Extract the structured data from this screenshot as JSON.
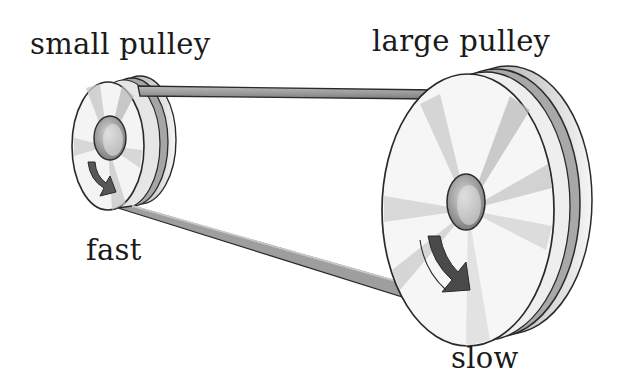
{
  "diagram": {
    "labels": {
      "small_pulley": "small pulley",
      "large_pulley": "large pulley",
      "small_speed": "fast",
      "large_speed": "slow"
    },
    "components": [
      {
        "id": "small-pulley",
        "label": "small pulley",
        "speed": "fast",
        "rotation": "clockwise"
      },
      {
        "id": "large-pulley",
        "label": "large pulley",
        "speed": "slow",
        "rotation": "clockwise"
      },
      {
        "id": "belt",
        "connects": [
          "small-pulley",
          "large-pulley"
        ]
      }
    ],
    "colors": {
      "background": "#ffffff",
      "outline": "#2a2a2a",
      "belt": "#9a9a9a",
      "face_light": "#f2f2f2",
      "face_shade": "#bdbdbd",
      "arrow": "#4a4a4a",
      "text": "#1a1a1a"
    }
  }
}
